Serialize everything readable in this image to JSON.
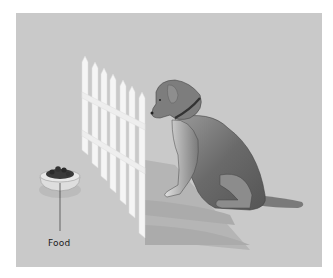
{
  "figure": {
    "labels": [
      {
        "id": "food",
        "text": "Food"
      }
    ],
    "colors": {
      "background": "#ffffff",
      "panel": "#c9c9c9",
      "fence": "#f4f4f4",
      "dog": "#6e6e6e",
      "shadow": "#b2b2b2"
    }
  }
}
